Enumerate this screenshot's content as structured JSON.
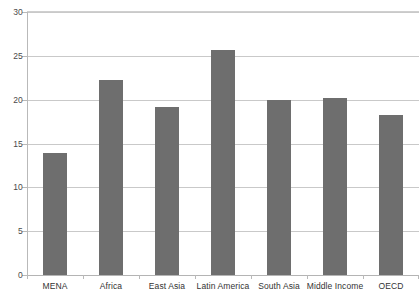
{
  "chart_data": {
    "type": "bar",
    "title": "",
    "subtitle": "",
    "xlabel": "",
    "ylabel": "",
    "categories": [
      "MENA",
      "Africa",
      "East Asia",
      "Latin America",
      "South Asia",
      "Middle Income",
      "OECD"
    ],
    "values": [
      13.9,
      22.3,
      19.2,
      25.7,
      20.0,
      20.2,
      18.2
    ],
    "series": [
      {
        "name": "",
        "values": [
          13.9,
          22.3,
          19.2,
          25.7,
          20.0,
          20.2,
          18.2
        ]
      }
    ],
    "ylim": [
      0,
      30
    ],
    "yticks": [
      0,
      5,
      10,
      15,
      20,
      25,
      30
    ],
    "ytick_labels": [
      "0",
      "5",
      "10",
      "15",
      "20",
      "25",
      "30"
    ],
    "grid": true,
    "grid_axis": "y",
    "legend": false,
    "legend_position": "none",
    "bar_color": "#6e6e6e",
    "gridline_color": "#c9c9c9",
    "axis_color": "#b4b4b4",
    "background_color": "#ffffff",
    "annotations": []
  }
}
